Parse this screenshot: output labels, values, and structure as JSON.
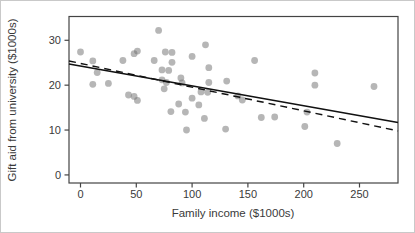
{
  "figure": {
    "xlabel": "Family income ($1000s)",
    "ylabel": "Gift aid from university ($1000s)"
  },
  "chart_data": {
    "type": "scatter",
    "title": "",
    "xlabel": "Family income ($1000s)",
    "ylabel": "Gift aid from university ($1000s)",
    "xlim": [
      -10.3,
      284.5
    ],
    "ylim": [
      -1.8,
      35.3
    ],
    "x_ticks": [
      0,
      50,
      100,
      150,
      200,
      250
    ],
    "y_ticks": [
      0,
      10,
      20,
      30
    ],
    "grid": false,
    "legend": "none",
    "point_color": "#6e6e6e",
    "point_opacity": 0.5,
    "axis_color": "#444444",
    "line_color": "#111111",
    "points": [
      [
        0,
        27.4
      ],
      [
        11,
        25.4
      ],
      [
        11,
        20.2
      ],
      [
        15,
        22.8
      ],
      [
        25,
        20.4
      ],
      [
        38,
        25.5
      ],
      [
        43,
        17.8
      ],
      [
        48,
        27.0
      ],
      [
        48,
        17.5
      ],
      [
        51,
        27.6
      ],
      [
        51,
        16.6
      ],
      [
        66,
        25.5
      ],
      [
        70,
        32.2
      ],
      [
        73,
        23.4
      ],
      [
        73,
        21.2
      ],
      [
        75,
        19.2
      ],
      [
        76,
        27.4
      ],
      [
        77,
        20.6
      ],
      [
        79,
        23.3
      ],
      [
        81,
        14.1
      ],
      [
        82,
        27.3
      ],
      [
        82,
        25.1
      ],
      [
        88,
        15.8
      ],
      [
        90,
        21.6
      ],
      [
        91,
        20.5
      ],
      [
        94,
        14.0
      ],
      [
        95,
        10.0
      ],
      [
        100,
        26.4
      ],
      [
        100,
        17.1
      ],
      [
        106,
        15.6
      ],
      [
        108,
        18.5
      ],
      [
        111,
        12.6
      ],
      [
        112,
        29.0
      ],
      [
        114,
        18.4
      ],
      [
        115,
        23.9
      ],
      [
        115,
        20.6
      ],
      [
        130,
        10.2
      ],
      [
        131,
        20.9
      ],
      [
        141,
        17.6
      ],
      [
        145,
        16.7
      ],
      [
        156,
        25.5
      ],
      [
        162,
        12.8
      ],
      [
        174,
        12.9
      ],
      [
        201,
        10.8
      ],
      [
        203,
        14.0
      ],
      [
        210,
        22.7
      ],
      [
        210,
        20.0
      ],
      [
        230,
        7.0
      ],
      [
        263,
        19.7
      ]
    ],
    "fit_lines": [
      {
        "name": "least-squares-line",
        "style": "solid",
        "x1": -10.3,
        "y1": 24.7,
        "x2": 284.5,
        "y2": 11.7
      },
      {
        "name": "alternative-fit-line",
        "style": "dashed",
        "x1": -10.3,
        "y1": 25.4,
        "x2": 284.5,
        "y2": 9.8
      }
    ]
  }
}
